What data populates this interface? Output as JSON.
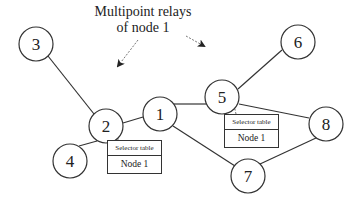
{
  "title": {
    "line1": "Multipoint relays",
    "line2": "of node 1"
  },
  "nodes": [
    {
      "id": "1",
      "label": "1",
      "cx": 160,
      "cy": 114
    },
    {
      "id": "2",
      "label": "2",
      "cx": 106,
      "cy": 126
    },
    {
      "id": "3",
      "label": "3",
      "cx": 36,
      "cy": 44
    },
    {
      "id": "4",
      "label": "4",
      "cx": 70,
      "cy": 161
    },
    {
      "id": "5",
      "label": "5",
      "cx": 222,
      "cy": 97
    },
    {
      "id": "6",
      "label": "6",
      "cx": 298,
      "cy": 42
    },
    {
      "id": "7",
      "label": "7",
      "cx": 248,
      "cy": 176
    },
    {
      "id": "8",
      "label": "8",
      "cx": 326,
      "cy": 124
    }
  ],
  "edges": [
    [
      "3",
      "2"
    ],
    [
      "2",
      "4"
    ],
    [
      "2",
      "1"
    ],
    [
      "1",
      "5"
    ],
    [
      "1",
      "7"
    ],
    [
      "5",
      "6"
    ],
    [
      "5",
      "8"
    ],
    [
      "8",
      "7"
    ]
  ],
  "selector_tables": [
    {
      "owner": "2",
      "header": "Selector table",
      "entry": "Node 1"
    },
    {
      "owner": "5",
      "header": "Selector table",
      "entry": "Node 1"
    }
  ]
}
